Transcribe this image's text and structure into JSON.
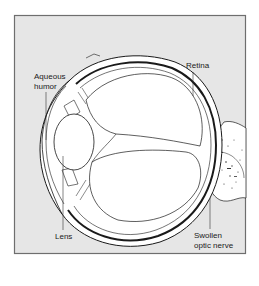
{
  "diagram": {
    "colors": {
      "background": "#e6e6e6",
      "frame": "#6e6e6e",
      "outline": "#1a1a1a",
      "fill": "#ffffff"
    },
    "labels": {
      "aqueous_humor_line1": "Aqueous",
      "aqueous_humor_line2": "humor",
      "retina": "Retina",
      "lens": "Lens",
      "optic_nerve_line1": "Swollen",
      "optic_nerve_line2": "optic nerve"
    }
  }
}
